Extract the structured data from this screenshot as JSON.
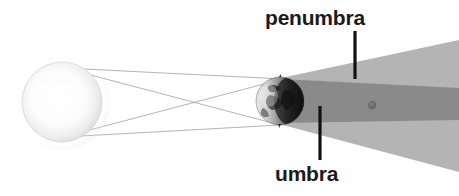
{
  "diagram": {
    "width": 459,
    "height": 196,
    "background_color": "#ffffff"
  },
  "labels": {
    "penumbra": "penumbra",
    "umbra": "umbra"
  },
  "colors": {
    "background": "#ffffff",
    "penumbra_fill": "#b4b4b4",
    "umbra_fill": "#8a8a8a",
    "leader_line": "#111111",
    "ray_line": "#8c8c93",
    "label_text": "#1a1a1a",
    "sun_core": "#ffffff",
    "sun_edge": "#d9d9d9",
    "earth_light": "#f2f2f2",
    "earth_dark": "#1d1d1d",
    "moon_dot": "#6e6e6e"
  },
  "bodies": {
    "sun": {
      "name": "sun",
      "center_x": 62,
      "center_y": 102,
      "radius": 40
    },
    "earth": {
      "name": "earth",
      "center_x": 280,
      "center_y": 101,
      "radius": 24
    },
    "moon": {
      "name": "moon",
      "center_x": 372,
      "center_y": 105,
      "radius": 4
    }
  },
  "shadow_cones": {
    "penumbra": {
      "apex_top": [
        281,
        78
      ],
      "apex_bottom": [
        279,
        124
      ],
      "right_top": [
        459,
        40
      ],
      "right_bottom": [
        459,
        172
      ]
    },
    "umbra": {
      "apex_top": [
        281,
        78
      ],
      "apex_bottom": [
        279,
        124
      ],
      "right_top": [
        459,
        88
      ],
      "right_bottom": [
        459,
        120
      ]
    }
  },
  "light_rays": [
    {
      "name": "ray-top-to-top",
      "x1": 64,
      "y1": 68,
      "x2": 283,
      "y2": 79
    },
    {
      "name": "ray-top-to-bottom",
      "x1": 64,
      "y1": 68,
      "x2": 280,
      "y2": 125
    },
    {
      "name": "ray-bottom-to-top",
      "x1": 63,
      "y1": 137,
      "x2": 283,
      "y2": 79
    },
    {
      "name": "ray-bottom-to-bottom",
      "x1": 63,
      "y1": 137,
      "x2": 280,
      "y2": 125
    }
  ],
  "leader_lines": [
    {
      "name": "penumbra-leader",
      "x": 355,
      "y1": 31,
      "y2": 79
    },
    {
      "name": "umbra-leader",
      "x": 320,
      "y1": 106,
      "y2": 160
    }
  ]
}
